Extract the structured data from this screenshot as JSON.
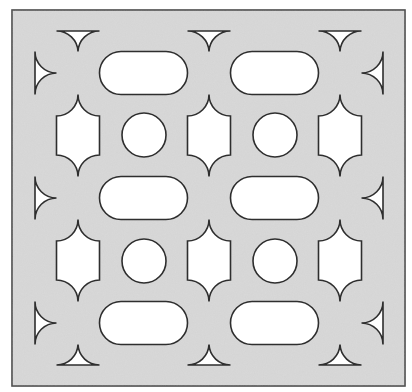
{
  "diagram": {
    "colors": {
      "page_background": "#ffffff",
      "panel_fill": "#d9d9d9",
      "panel_border": "#4a4a4a",
      "cutout_fill": "#ffffff",
      "cutout_stroke": "#2e2e2e"
    },
    "panel": {
      "x": 12,
      "y": 10,
      "width": 393,
      "height": 376
    },
    "nodes": {
      "columns_x": [
        78,
        209,
        340
      ],
      "rows_y": [
        73,
        198,
        323
      ],
      "tip_offset": 21.5,
      "arc_radius": 21.5
    },
    "circles": [
      {
        "cx": 144,
        "cy": 135,
        "r": 22
      },
      {
        "cx": 275,
        "cy": 135,
        "r": 22
      },
      {
        "cx": 144,
        "cy": 261,
        "r": 22
      },
      {
        "cx": 275,
        "cy": 261,
        "r": 22
      }
    ],
    "edge_triangles": {
      "top_base_y": 31,
      "bottom_base_y": 365,
      "left_base_x": 35,
      "right_base_x": 383
    },
    "shape_counts": {
      "horizontal_cutouts": 6,
      "vertical_cutouts": 6,
      "circles": 4,
      "edge_triangles": 12
    }
  }
}
